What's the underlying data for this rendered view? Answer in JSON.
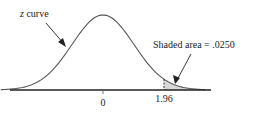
{
  "chart_data": {
    "type": "area",
    "title": "",
    "curve_label_prefix": "z",
    "curve_label_suffix": " curve",
    "shaded_label": "Shaded area = .0250",
    "shaded_area": 0.025,
    "shaded_region": {
      "from": 1.96,
      "to": "infinity"
    },
    "tick_labels": [
      "0",
      "1.96"
    ],
    "x_ticks": [
      0,
      1.96
    ],
    "xlim": [
      -3.3,
      3.3
    ],
    "grid": false,
    "legend": "none",
    "colors": {
      "curve": "#555555",
      "shade": "#d8d8d8",
      "axis": "#222222"
    }
  }
}
